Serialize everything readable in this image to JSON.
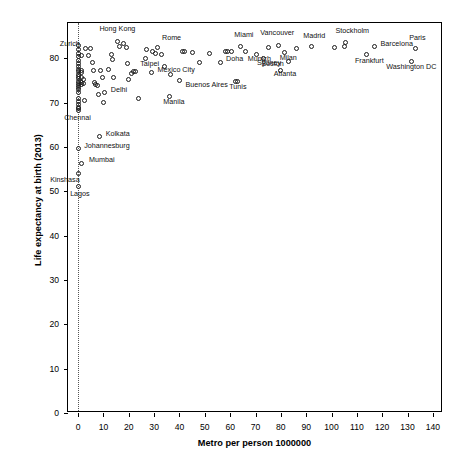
{
  "chart_data": {
    "type": "scatter",
    "title": "",
    "xlabel": "Metro per person 1000000",
    "ylabel": "Life expectancy at birth (2013)",
    "xlim": [
      -4,
      144
    ],
    "ylim": [
      0,
      88
    ],
    "xticks": [
      0,
      10,
      20,
      30,
      40,
      50,
      60,
      70,
      80,
      90,
      100,
      110,
      120,
      130,
      140
    ],
    "yticks": [
      0,
      10,
      20,
      30,
      40,
      50,
      60,
      70,
      80
    ],
    "grid": false,
    "legend": "none",
    "annotations": [
      {
        "text": "vertical dotted reference line at x = 0",
        "x": 0
      }
    ],
    "points": [
      {
        "label": "Zurich",
        "x": 3.0,
        "y": 82.3,
        "lx": -26,
        "ly": -4
      },
      {
        "label": "Hong Kong",
        "x": 15.5,
        "y": 83.8,
        "lx": -18,
        "ly": -13
      },
      {
        "label": "Rome",
        "x": 31.5,
        "y": 82.4,
        "lx": 4,
        "ly": -10
      },
      {
        "label": "Miami",
        "x": 64.0,
        "y": 82.7,
        "lx": -6,
        "ly": -11
      },
      {
        "label": "Vancouver",
        "x": 79.0,
        "y": 83.0,
        "lx": -18,
        "ly": -12
      },
      {
        "label": "Stockholm",
        "x": 105.5,
        "y": 83.7,
        "lx": -10,
        "ly": -11
      },
      {
        "label": "Barcelona",
        "x": 117.0,
        "y": 82.6,
        "lx": 6,
        "ly": -3
      },
      {
        "label": "Madrid",
        "x": 92.0,
        "y": 82.8,
        "lx": -8,
        "ly": -10
      },
      {
        "label": "Frankfurt",
        "x": 114.0,
        "y": 80.8,
        "lx": -12,
        "ly": 6
      },
      {
        "label": "Paris",
        "x": 133.0,
        "y": 82.3,
        "lx": -6,
        "ly": -10
      },
      {
        "label": "Washington DC",
        "x": 131.5,
        "y": 79.4,
        "lx": -25,
        "ly": 6
      },
      {
        "label": "Munich",
        "x": 70.5,
        "y": 81.0,
        "lx": -9,
        "ly": 5
      },
      {
        "label": "Sydney",
        "x": 73.0,
        "y": 80.0,
        "lx": -6,
        "ly": 5
      },
      {
        "label": "Milan",
        "x": 81.5,
        "y": 81.4,
        "lx": -5,
        "ly": 6
      },
      {
        "label": "Boston",
        "x": 83.0,
        "y": 79.3,
        "lx": -27,
        "ly": 2
      },
      {
        "label": "Atlanta",
        "x": 80.0,
        "y": 77.3,
        "lx": -7,
        "ly": 4
      },
      {
        "label": "Taipei",
        "x": 26.5,
        "y": 80.0,
        "lx": -5,
        "ly": 6
      },
      {
        "label": "Doha",
        "x": 56.0,
        "y": 79.2,
        "lx": 6,
        "ly": -3
      },
      {
        "label": "Mexico City",
        "x": 29.0,
        "y": 76.8,
        "lx": 6,
        "ly": -3
      },
      {
        "label": "Buenos Aires",
        "x": 40.0,
        "y": 75.0,
        "lx": 6,
        "ly": 4
      },
      {
        "label": "Tunis",
        "x": 62.0,
        "y": 74.9,
        "lx": -6,
        "ly": 6
      },
      {
        "label": "Delhi",
        "x": 10.5,
        "y": 72.3,
        "lx": 6,
        "ly": -3
      },
      {
        "label": "Manila",
        "x": 36.0,
        "y": 71.5,
        "lx": -6,
        "ly": 6
      },
      {
        "label": "Chennai",
        "x": 0.0,
        "y": 68.2,
        "lx": -14,
        "ly": 7
      },
      {
        "label": "Kolkata",
        "x": 8.5,
        "y": 62.3,
        "lx": 6,
        "ly": -3
      },
      {
        "label": "Johannesburg",
        "x": 0.0,
        "y": 59.6,
        "lx": 6,
        "ly": -3
      },
      {
        "label": "Mumbai",
        "x": 1.5,
        "y": 56.4,
        "lx": 7,
        "ly": -3
      },
      {
        "label": "Kinshasa",
        "x": 0.0,
        "y": 54.0,
        "lx": -28,
        "ly": 6
      },
      {
        "label": "Lagos",
        "x": 0.0,
        "y": 51.0,
        "lx": -8,
        "ly": 7
      }
    ],
    "unlabeled_points": [
      {
        "x": 0.0,
        "y": 83.0
      },
      {
        "x": 0.0,
        "y": 82.0
      },
      {
        "x": 0.0,
        "y": 81.2
      },
      {
        "x": 0.0,
        "y": 80.4
      },
      {
        "x": 0.0,
        "y": 79.6
      },
      {
        "x": 0.0,
        "y": 78.9
      },
      {
        "x": 0.0,
        "y": 78.2
      },
      {
        "x": 0.0,
        "y": 77.6
      },
      {
        "x": 0.0,
        "y": 77.0
      },
      {
        "x": 0.0,
        "y": 76.4
      },
      {
        "x": 0.0,
        "y": 75.9
      },
      {
        "x": 0.0,
        "y": 75.4
      },
      {
        "x": 0.0,
        "y": 74.9
      },
      {
        "x": 0.0,
        "y": 74.4
      },
      {
        "x": 0.0,
        "y": 73.9
      },
      {
        "x": 0.0,
        "y": 73.4
      },
      {
        "x": 0.0,
        "y": 72.9
      },
      {
        "x": 0.0,
        "y": 72.3
      },
      {
        "x": 0.0,
        "y": 71.0
      },
      {
        "x": 0.0,
        "y": 70.2
      },
      {
        "x": 0.0,
        "y": 69.6
      },
      {
        "x": 0.0,
        "y": 69.0
      },
      {
        "x": 0.0,
        "y": 68.6
      },
      {
        "x": 1.2,
        "y": 80.6
      },
      {
        "x": 1.2,
        "y": 77.3
      },
      {
        "x": 1.2,
        "y": 76.8
      },
      {
        "x": 1.2,
        "y": 75.6
      },
      {
        "x": 1.2,
        "y": 74.6
      },
      {
        "x": 1.2,
        "y": 74.1
      },
      {
        "x": 2.0,
        "y": 75.2
      },
      {
        "x": 2.0,
        "y": 74.4
      },
      {
        "x": 2.5,
        "y": 70.5
      },
      {
        "x": 4.0,
        "y": 80.6
      },
      {
        "x": 5.0,
        "y": 82.3
      },
      {
        "x": 5.5,
        "y": 79.0
      },
      {
        "x": 6.0,
        "y": 77.3
      },
      {
        "x": 6.5,
        "y": 74.6
      },
      {
        "x": 7.0,
        "y": 74.2
      },
      {
        "x": 7.5,
        "y": 74.0
      },
      {
        "x": 8.0,
        "y": 71.9
      },
      {
        "x": 9.0,
        "y": 77.2
      },
      {
        "x": 9.5,
        "y": 75.6
      },
      {
        "x": 10.0,
        "y": 70.0
      },
      {
        "x": 12.0,
        "y": 77.6
      },
      {
        "x": 13.0,
        "y": 81.0
      },
      {
        "x": 13.5,
        "y": 79.8
      },
      {
        "x": 14.0,
        "y": 75.6
      },
      {
        "x": 16.5,
        "y": 82.6
      },
      {
        "x": 18.0,
        "y": 83.3
      },
      {
        "x": 19.0,
        "y": 82.5
      },
      {
        "x": 19.5,
        "y": 78.9
      },
      {
        "x": 20.0,
        "y": 75.2
      },
      {
        "x": 21.0,
        "y": 76.6
      },
      {
        "x": 22.0,
        "y": 77.0
      },
      {
        "x": 22.8,
        "y": 77.1
      },
      {
        "x": 24.0,
        "y": 71.0
      },
      {
        "x": 27.0,
        "y": 82.1
      },
      {
        "x": 29.5,
        "y": 81.5
      },
      {
        "x": 30.5,
        "y": 81.2
      },
      {
        "x": 33.0,
        "y": 80.9
      },
      {
        "x": 34.0,
        "y": 78.2
      },
      {
        "x": 36.5,
        "y": 76.3
      },
      {
        "x": 41.0,
        "y": 81.5
      },
      {
        "x": 42.0,
        "y": 81.5
      },
      {
        "x": 45.0,
        "y": 81.3
      },
      {
        "x": 48.0,
        "y": 79.1
      },
      {
        "x": 52.0,
        "y": 81.2
      },
      {
        "x": 58.0,
        "y": 81.6
      },
      {
        "x": 59.0,
        "y": 81.6
      },
      {
        "x": 60.5,
        "y": 81.6
      },
      {
        "x": 66.0,
        "y": 81.5
      },
      {
        "x": 63.0,
        "y": 74.8
      },
      {
        "x": 75.0,
        "y": 82.5
      },
      {
        "x": 86.0,
        "y": 82.2
      },
      {
        "x": 101.0,
        "y": 82.5
      },
      {
        "x": 105.0,
        "y": 82.6
      }
    ]
  }
}
